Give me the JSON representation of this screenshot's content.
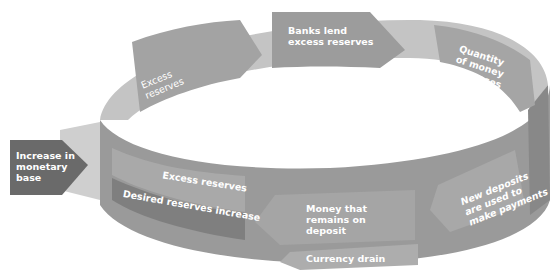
{
  "diagram": {
    "type": "cycle-ring",
    "title": "",
    "colors": {
      "background": "#ffffff",
      "ring_light": "#c9c9c9",
      "ring_mid": "#a7a7a7",
      "ring_dark": "#8d8d8d",
      "arrow_dark": "#7a7a7a",
      "entry_box": "#6d6d6d",
      "text": "#ffffff"
    },
    "entry": {
      "label_lines": [
        "Increase in",
        "monetary",
        "base"
      ]
    },
    "top_steps": [
      {
        "id": "excess-reserves-top",
        "label_lines": [
          "Excess",
          "reserves"
        ]
      },
      {
        "id": "banks-lend",
        "label_lines": [
          "Banks lend",
          "excess reserves"
        ]
      },
      {
        "id": "quantity-of-money",
        "label_lines": [
          "Quantity",
          "of money",
          "increases"
        ]
      }
    ],
    "bottom_steps": [
      {
        "id": "new-deposits",
        "label_lines": [
          "New deposits",
          "are used to",
          "make payments"
        ]
      },
      {
        "id": "money-remains",
        "label_lines": [
          "Money that",
          "remains on",
          "deposit"
        ]
      },
      {
        "id": "currency-drain",
        "label_lines": [
          "Currency drain"
        ]
      },
      {
        "id": "excess-reserves-bottom",
        "label_lines": [
          "Excess reserves"
        ]
      },
      {
        "id": "desired-reserves",
        "label_lines": [
          "Desired reserves increase"
        ]
      }
    ]
  }
}
